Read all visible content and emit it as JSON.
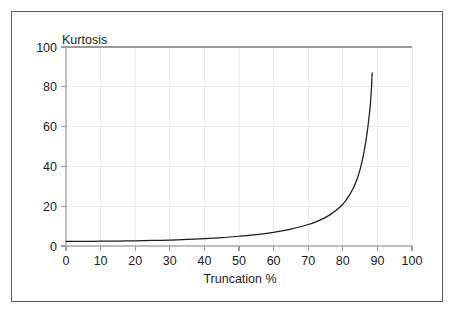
{
  "figure": {
    "background_color": "#ffffff",
    "border_color": "#5a5a5a",
    "grid_color": "#ededed",
    "curve_color": "#1a1a1a"
  },
  "chart_data": {
    "type": "line",
    "title": "Kurtosis",
    "title_position": "top-left-inside",
    "xlabel": "Truncation %",
    "ylabel": "",
    "ylabel_as_title": "Kurtosis",
    "xlim": [
      0,
      100
    ],
    "ylim": [
      0,
      100
    ],
    "xticks": [
      0,
      10,
      20,
      30,
      40,
      50,
      60,
      70,
      80,
      90,
      100
    ],
    "xtick_labels": [
      "0",
      "10",
      "20",
      "30",
      "40",
      "50",
      "60",
      "70",
      "80",
      "90",
      "100"
    ],
    "yticks": [
      0,
      20,
      40,
      60,
      80,
      100
    ],
    "ytick_labels": [
      "0",
      "20",
      "40",
      "60",
      "80",
      "100"
    ],
    "grid": true,
    "legend": "none",
    "series": [
      {
        "name": "Kurtosis vs Truncation %",
        "x": [
          0,
          5,
          10,
          15,
          20,
          25,
          30,
          35,
          40,
          45,
          50,
          55,
          60,
          65,
          70,
          72,
          74,
          76,
          78,
          80,
          81,
          82,
          83,
          84,
          85,
          86,
          87,
          88,
          88.5
        ],
        "values": [
          2.3,
          2.35,
          2.4,
          2.5,
          2.6,
          2.8,
          3.0,
          3.3,
          3.7,
          4.2,
          4.9,
          5.7,
          6.9,
          8.5,
          10.8,
          12.0,
          13.5,
          15.4,
          17.8,
          21.0,
          23.2,
          25.8,
          29.0,
          33.0,
          38.5,
          46.0,
          56.5,
          72.0,
          87.0
        ]
      }
    ]
  }
}
